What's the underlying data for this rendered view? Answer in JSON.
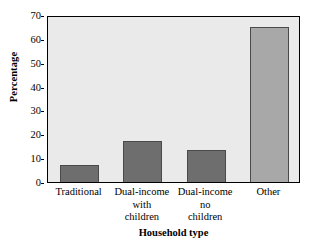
{
  "chart_data": {
    "type": "bar",
    "title": "",
    "xlabel": "Household type",
    "ylabel": "Percentage",
    "categories": [
      "Traditional",
      "Dual-income with children",
      "Dual-income no children",
      "Other"
    ],
    "category_lines": [
      [
        "Traditional"
      ],
      [
        "Dual-income",
        "with",
        "children"
      ],
      [
        "Dual-income",
        "no",
        "children"
      ],
      [
        "Other"
      ]
    ],
    "values": [
      7,
      17,
      13.5,
      65
    ],
    "ylim": [
      0,
      70
    ],
    "yticks": [
      0,
      10,
      20,
      30,
      40,
      50,
      60,
      70
    ],
    "ytick_labels": [
      "0",
      "10",
      "20",
      "30",
      "40",
      "50",
      "60",
      "70"
    ],
    "grid": false,
    "legend": "none",
    "bar_colors": [
      "#6e6e6e",
      "#6e6e6e",
      "#6e6e6e",
      "#a8a8a8"
    ],
    "bar_border_color": "#4a4a4a",
    "plot_background": "#eaeaea",
    "axis_color": "#000000",
    "figure_background": "#ffffff"
  }
}
